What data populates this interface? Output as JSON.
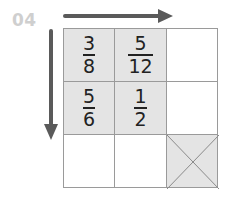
{
  "problem_number": "04",
  "arrows": {
    "horizontal": "right-arrow",
    "vertical": "down-arrow"
  },
  "grid": {
    "rows": 3,
    "cols": 3,
    "cells": [
      [
        {
          "numerator": "3",
          "denominator": "8",
          "shaded": true
        },
        {
          "numerator": "5",
          "denominator": "12",
          "shaded": true
        },
        {
          "empty": true
        }
      ],
      [
        {
          "numerator": "5",
          "denominator": "6",
          "shaded": true
        },
        {
          "numerator": "1",
          "denominator": "2",
          "shaded": true
        },
        {
          "empty": true
        }
      ],
      [
        {
          "empty": true
        },
        {
          "empty": true
        },
        {
          "crossed": true,
          "shaded": true
        }
      ]
    ]
  },
  "colors": {
    "shade": "#e4e4e4",
    "arrow": "#5a5a5a",
    "border": "#9a9a9a",
    "number": "#cfcfcf"
  }
}
